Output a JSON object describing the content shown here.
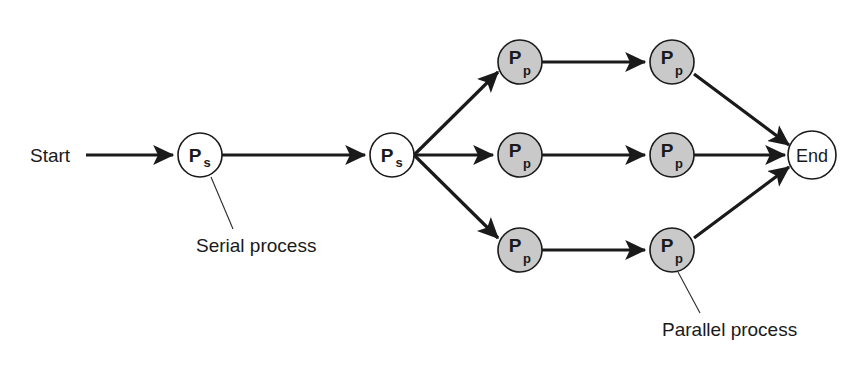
{
  "diagram": {
    "background_color": "#ffffff",
    "stroke_color": "#1a1a1a",
    "serial_node_fill": "#ffffff",
    "parallel_node_fill": "#c9c9c9",
    "terminal_fill": "#ffffff",
    "start_label": "Start",
    "end_label": "End",
    "serial_caption": "Serial process",
    "parallel_caption": "Parallel process",
    "serial_nodes": [
      {
        "id": "ps1",
        "main": "P",
        "sub": "s",
        "cx": 200,
        "cy": 155,
        "r": 22
      },
      {
        "id": "ps2",
        "main": "P",
        "sub": "s",
        "cx": 392,
        "cy": 155,
        "r": 22
      }
    ],
    "parallel_nodes": [
      {
        "id": "pp-top-left",
        "main": "P",
        "sub": "p",
        "cx": 520,
        "cy": 62,
        "r": 22
      },
      {
        "id": "pp-top-right",
        "main": "P",
        "sub": "p",
        "cx": 672,
        "cy": 62,
        "r": 22
      },
      {
        "id": "pp-mid-left",
        "main": "P",
        "sub": "p",
        "cx": 520,
        "cy": 155,
        "r": 22
      },
      {
        "id": "pp-mid-right",
        "main": "P",
        "sub": "p",
        "cx": 672,
        "cy": 155,
        "r": 22
      },
      {
        "id": "pp-bot-left",
        "main": "P",
        "sub": "p",
        "cx": 520,
        "cy": 250,
        "r": 22
      },
      {
        "id": "pp-bot-right",
        "main": "P",
        "sub": "p",
        "cx": 672,
        "cy": 250,
        "r": 22
      }
    ],
    "terminal_node": {
      "id": "end",
      "label": "End",
      "cx": 812,
      "cy": 155,
      "r": 24
    },
    "start_text_position": {
      "x": 30,
      "y": 162
    },
    "serial_caption_position": {
      "x": 196,
      "y": 252
    },
    "parallel_caption_position": {
      "x": 662,
      "y": 336
    }
  }
}
